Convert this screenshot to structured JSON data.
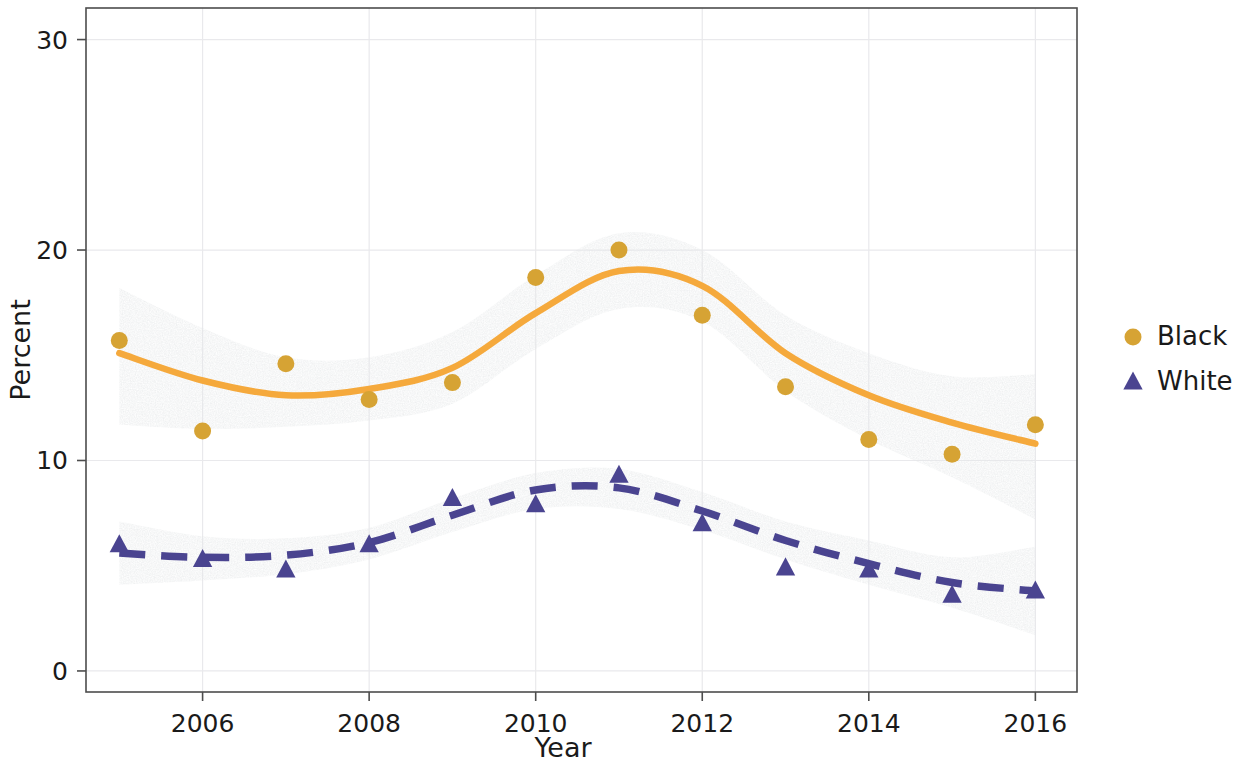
{
  "chart_data": {
    "type": "line",
    "title": "",
    "xlabel": "Year",
    "ylabel": "Percent",
    "grid": true,
    "legend_position": "right",
    "xlim": [
      2004.6,
      2016.5
    ],
    "ylim": [
      -1.0,
      31.5
    ],
    "xticks": [
      2006,
      2008,
      2010,
      2012,
      2014,
      2016
    ],
    "yticks": [
      0,
      10,
      20,
      30
    ],
    "x": [
      2005,
      2006,
      2007,
      2008,
      2009,
      2010,
      2011,
      2012,
      2013,
      2014,
      2015,
      2016
    ],
    "series": [
      {
        "name": "Black",
        "marker": "circle",
        "color": "#d6a334",
        "line_color": "#f5a93c",
        "line_style": "solid",
        "values": [
          15.7,
          11.4,
          14.6,
          12.9,
          13.7,
          18.7,
          20.0,
          16.9,
          13.5,
          11.0,
          10.3,
          11.7
        ],
        "fit": [
          15.1,
          13.8,
          13.1,
          13.4,
          14.4,
          17.0,
          19.0,
          18.3,
          15.1,
          13.1,
          11.8,
          10.8
        ],
        "ci_low": [
          11.7,
          11.5,
          11.6,
          11.9,
          12.7,
          15.3,
          17.2,
          16.6,
          13.3,
          11.0,
          9.2,
          7.2
        ],
        "ci_high": [
          18.2,
          16.3,
          14.9,
          14.9,
          16.1,
          18.8,
          20.8,
          20.0,
          16.9,
          15.1,
          14.0,
          14.1
        ]
      },
      {
        "name": "White",
        "marker": "triangle",
        "color": "#4a4490",
        "line_color": "#4a4490",
        "line_style": "dashed",
        "values": [
          6.0,
          5.3,
          4.8,
          6.0,
          8.2,
          7.9,
          9.3,
          7.0,
          4.9,
          4.8,
          3.6,
          3.8
        ],
        "fit": [
          5.6,
          5.4,
          5.5,
          6.1,
          7.4,
          8.6,
          8.7,
          7.6,
          6.2,
          5.1,
          4.2,
          3.8
        ],
        "ci_low": [
          4.1,
          4.3,
          4.6,
          5.3,
          6.6,
          7.7,
          7.7,
          6.7,
          5.3,
          4.1,
          3.0,
          1.7
        ],
        "ci_high": [
          7.1,
          6.4,
          6.3,
          6.8,
          8.2,
          9.4,
          9.6,
          8.5,
          7.1,
          6.2,
          5.4,
          5.9
        ]
      }
    ]
  },
  "legend": {
    "items": [
      {
        "label": "Black",
        "marker": "circle",
        "color": "#d6a334"
      },
      {
        "label": "White",
        "marker": "triangle",
        "color": "#4a4490"
      }
    ]
  },
  "axes": {
    "y_title": "Percent",
    "x_title": "Year",
    "y_tick_labels": [
      "30",
      "20",
      "10",
      "0"
    ],
    "x_tick_labels": [
      "2006",
      "2008",
      "2010",
      "2012",
      "2014",
      "2016"
    ]
  }
}
